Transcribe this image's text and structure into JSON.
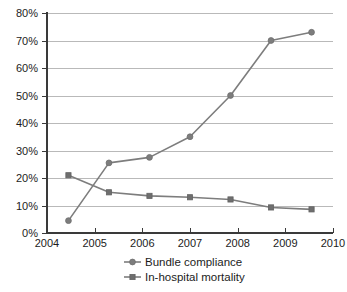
{
  "chart_data": {
    "type": "line",
    "title": "",
    "subtitle": "",
    "xlabel": "",
    "ylabel": "",
    "xlim": [
      2004,
      2010
    ],
    "ylim": [
      0,
      80
    ],
    "grid": "horizontal",
    "legend_position": "bottom-center",
    "x_tick_labels": [
      "2004",
      "2005",
      "2006",
      "2007",
      "2008",
      "2009",
      "2010"
    ],
    "x_ticks": [
      2004,
      2005,
      2006,
      2007,
      2008,
      2009,
      2010
    ],
    "y_tick_labels": [
      "0%",
      "10%",
      "20%",
      "30%",
      "40%",
      "50%",
      "60%",
      "70%",
      "80%"
    ],
    "y_ticks": [
      0,
      10,
      20,
      30,
      40,
      50,
      60,
      70,
      80
    ],
    "series": [
      {
        "name": "Bundle compliance",
        "marker": "circle",
        "color": "#7d7d7d",
        "x": [
          2004.45,
          2005.3,
          2006.15,
          2007.0,
          2007.85,
          2008.7,
          2009.55
        ],
        "values": [
          4.5,
          25.5,
          27.5,
          35.0,
          50.0,
          70.0,
          73.0
        ]
      },
      {
        "name": "In-hospital mortality",
        "marker": "square",
        "color": "#6e6e6e",
        "x": [
          2004.45,
          2005.3,
          2006.15,
          2007.0,
          2007.85,
          2008.7,
          2009.55
        ],
        "values": [
          21.0,
          14.8,
          13.5,
          13.0,
          12.2,
          9.3,
          8.6
        ]
      }
    ]
  },
  "legend": {
    "entries": [
      {
        "label": "Bundle compliance"
      },
      {
        "label": "In-hospital mortality"
      }
    ]
  }
}
